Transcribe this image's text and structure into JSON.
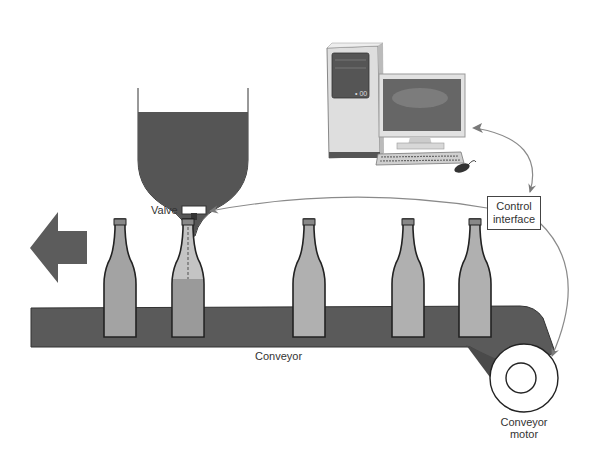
{
  "diagram": {
    "labels": {
      "valve": "Valve",
      "control_interface_line1": "Control",
      "control_interface_line2": "interface",
      "conveyor": "Conveyor",
      "conveyor_motor_line1": "Conveyor",
      "conveyor_motor_line2": "motor"
    },
    "components": [
      {
        "id": "hopper",
        "name": "Liquid hopper"
      },
      {
        "id": "valve",
        "name": "Valve"
      },
      {
        "id": "computer",
        "name": "Computer (tower, monitor, keyboard, mouse)"
      },
      {
        "id": "control-interface",
        "name": "Control interface"
      },
      {
        "id": "conveyor",
        "name": "Conveyor belt"
      },
      {
        "id": "conveyor-motor",
        "name": "Conveyor motor"
      },
      {
        "id": "direction-arrow",
        "name": "Direction of travel (left)"
      }
    ],
    "bottles": [
      {
        "position": 1,
        "state": "full"
      },
      {
        "position": 2,
        "state": "filling"
      },
      {
        "position": 3,
        "state": "empty"
      },
      {
        "position": 4,
        "state": "empty"
      },
      {
        "position": 5,
        "state": "empty"
      }
    ],
    "connections": [
      {
        "from": "computer",
        "to": "control-interface",
        "bidirectional": true
      },
      {
        "from": "control-interface",
        "to": "valve"
      },
      {
        "from": "control-interface",
        "to": "conveyor-motor"
      }
    ],
    "colors": {
      "liquid": "#555555",
      "belt": "#5a5a5a",
      "bottle": "#a8a8a8",
      "arrow": "#5c5c5c",
      "connector": "#888888"
    }
  }
}
